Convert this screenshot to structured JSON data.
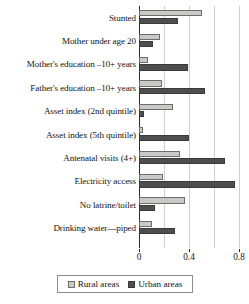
{
  "chart_data": {
    "type": "bar",
    "orientation": "horizontal",
    "title": "",
    "subtitle": "",
    "xlabel": "",
    "ylabel": "",
    "xlim": [
      0,
      0.88
    ],
    "xticks": [
      0,
      0.4,
      0.8
    ],
    "xtick_labels": [
      "0",
      "0.4",
      "0.8"
    ],
    "gridlines": [
      0.2,
      0.4,
      0.6,
      0.8
    ],
    "grid": true,
    "legend_position": "bottom-center",
    "categories": [
      "Stunted",
      "Mother under age 20",
      "Mother's education –10+ years",
      "Father's education –10+ years",
      "Asset index (2nd quintile)",
      "Asset index (5th quintile)",
      "Antenatal visits (4+)",
      "Electricity access",
      "No latrine/toilet",
      "Drinking water—piped"
    ],
    "series": [
      {
        "name": "Rural areas",
        "color": "#c9c9c7",
        "values": [
          0.5,
          0.17,
          0.07,
          0.18,
          0.27,
          0.03,
          0.33,
          0.19,
          0.37,
          0.1
        ]
      },
      {
        "name": "Urban areas",
        "color": "#4e4e4e",
        "values": [
          0.31,
          0.11,
          0.39,
          0.53,
          0.04,
          0.4,
          0.69,
          0.77,
          0.13,
          0.29
        ]
      }
    ]
  },
  "legend": {
    "items": [
      {
        "label": "Rural areas",
        "swatch": "rural-swatch"
      },
      {
        "label": "Urban areas",
        "swatch": "urban-swatch"
      }
    ]
  }
}
